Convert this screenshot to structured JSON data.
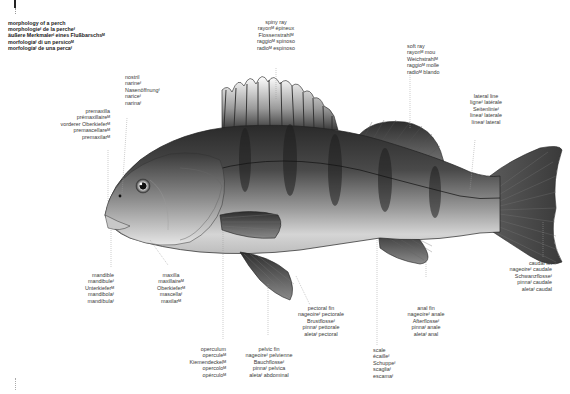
{
  "title": {
    "lines": [
      "morphology of a perch",
      "morphologieᶠ de la percheᶠ",
      "äußere Merkmaleᵖˡ eines Flußbarschsᴹ",
      "morfologiaᶠ di un persicoᴹ",
      "morfologíaᶠ de una percaᶠ"
    ]
  },
  "labels": {
    "spiny_ray": [
      "spiny ray",
      "rayonᴹ épineux",
      "Flossenstrahlᴹ",
      "raggioᴹ spinoso",
      "radioᴹ espinoso"
    ],
    "soft_ray": [
      "soft ray",
      "rayonᴹ mou",
      "Weichstrahlᴹ",
      "raggioᴹ molle",
      "radioᴹ blando"
    ],
    "lateral_line": [
      "lateral line",
      "ligneᶠ latérale",
      "Seitenlinieᶠ",
      "lineaᶠ laterale",
      "líneaᶠ lateral"
    ],
    "nostril": [
      "nostril",
      "narineᶠ",
      "Nasenöffnungᶠ",
      "nariceᶠ",
      "narinaᶠ"
    ],
    "premaxilla": [
      "premaxilla",
      "prémaxillaireᴹ",
      "vorderer Oberkieferᴹ",
      "premascellareᴹ",
      "premaxilarᴹ"
    ],
    "mandible": [
      "mandible",
      "mandibuleᶠ",
      "Unterkieferᴹ",
      "mandibolaᶠ",
      "mandíbulaᶠ"
    ],
    "maxilla": [
      "maxilla",
      "maxillaireᴹ",
      "Oberkieferᴹ",
      "mascellaᶠ",
      "maxilarᴹ"
    ],
    "operculum": [
      "operculum",
      "operculeᴹ",
      "Kiemendeckelᴹ",
      "opercoloᴹ",
      "opérculoᴹ"
    ],
    "pelvic_fin": [
      "pelvic fin",
      "nageoireᶠ pelvienne",
      "Bauchflosseᶠ",
      "pinnaᶠ pelvica",
      "aletaᶠ abdominal"
    ],
    "pectoral_fin": [
      "pectoral fin",
      "nageoireᶠ pectorale",
      "Brustflosseᶠ",
      "pinnaᶠ pettorale",
      "aletaᶠ pectoral"
    ],
    "scale": [
      "scale",
      "écailleᶠ",
      "Schuppeᶠ",
      "scagliaᶠ",
      "escamaᶠ"
    ],
    "anal_fin": [
      "anal fin",
      "nageoireᶠ anale",
      "Afterflosseᶠ",
      "pinnaᶠ anale",
      "aletaᶠ anal"
    ],
    "caudal_fin": [
      "caudal fin",
      "nageoireᶠ caudale",
      "Schwanzflosseᶠ",
      "pinnaᶠ caudale",
      "aletaᶠ caudal"
    ]
  },
  "colors": {
    "background": "#ffffff",
    "fish_dark": "#2b2b2b",
    "fish_mid": "#6e6e6e",
    "fish_light": "#d8d8d8",
    "leader_line": "#9a9a9a",
    "text": "#3a3a3a"
  }
}
